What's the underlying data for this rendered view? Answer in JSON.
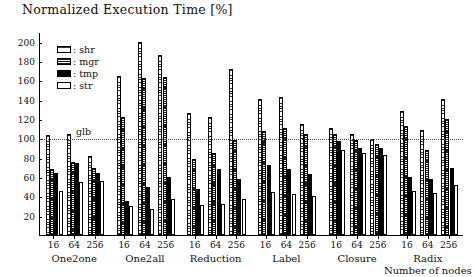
{
  "chart_data": {
    "type": "bar",
    "title": "Normalized Execution Time [%]",
    "xlabel": "Number of nodes",
    "ylabel": "",
    "ylim": [
      0,
      210
    ],
    "yticks": [
      20,
      40,
      60,
      80,
      100,
      120,
      140,
      160,
      180,
      200
    ],
    "grid": false,
    "legend_position": "upper-left-inside",
    "reference_line": {
      "label": "glb",
      "value": 100,
      "style": "dotted"
    },
    "group_labels": [
      "One2one",
      "One2all",
      "Reduction",
      "Label",
      "Closure",
      "Radix"
    ],
    "categories": [
      "16",
      "64",
      "256"
    ],
    "series": [
      {
        "name": "shr",
        "pattern": "light-horizontal-hatch"
      },
      {
        "name": "mgr",
        "pattern": "dense-horizontal-hatch"
      },
      {
        "name": "tmp",
        "pattern": "solid-black"
      },
      {
        "name": "str",
        "pattern": "white-outline"
      }
    ],
    "groups": [
      {
        "group": "One2one",
        "nodes": [
          {
            "node": "16",
            "shr": 103,
            "mgr": 68,
            "tmp": 64,
            "str": 46
          },
          {
            "node": "64",
            "shr": 104,
            "mgr": 76,
            "tmp": 74,
            "str": 55
          },
          {
            "node": "256",
            "shr": 82,
            "mgr": 69,
            "tmp": 64,
            "str": 56
          }
        ]
      },
      {
        "group": "One2all",
        "nodes": [
          {
            "node": "16",
            "shr": 165,
            "mgr": 122,
            "tmp": 35,
            "str": 30
          },
          {
            "node": "64",
            "shr": 200,
            "mgr": 162,
            "tmp": 50,
            "str": 27
          },
          {
            "node": "256",
            "shr": 186,
            "mgr": 163,
            "tmp": 60,
            "str": 37
          }
        ]
      },
      {
        "group": "Reduction",
        "nodes": [
          {
            "node": "16",
            "shr": 126,
            "mgr": 79,
            "tmp": 48,
            "str": 31
          },
          {
            "node": "64",
            "shr": 122,
            "mgr": 85,
            "tmp": 68,
            "str": 32
          },
          {
            "node": "256",
            "shr": 172,
            "mgr": 98,
            "tmp": 58,
            "str": 37
          }
        ]
      },
      {
        "group": "Label",
        "nodes": [
          {
            "node": "16",
            "shr": 141,
            "mgr": 108,
            "tmp": 72,
            "str": 44
          },
          {
            "node": "64",
            "shr": 143,
            "mgr": 111,
            "tmp": 68,
            "str": 42
          },
          {
            "node": "256",
            "shr": 115,
            "mgr": 104,
            "tmp": 63,
            "str": 40
          }
        ]
      },
      {
        "group": "Closure",
        "nodes": [
          {
            "node": "16",
            "shr": 111,
            "mgr": 105,
            "tmp": 97,
            "str": 88
          },
          {
            "node": "64",
            "shr": 104,
            "mgr": 98,
            "tmp": 90,
            "str": 85
          },
          {
            "node": "256",
            "shr": 99,
            "mgr": 94,
            "tmp": 90,
            "str": 83
          }
        ]
      },
      {
        "group": "Radix",
        "nodes": [
          {
            "node": "16",
            "shr": 128,
            "mgr": 113,
            "tmp": 60,
            "str": 46
          },
          {
            "node": "64",
            "shr": 109,
            "mgr": 88,
            "tmp": 58,
            "str": 43
          },
          {
            "node": "256",
            "shr": 141,
            "mgr": 120,
            "tmp": 69,
            "str": 52
          }
        ]
      }
    ]
  }
}
